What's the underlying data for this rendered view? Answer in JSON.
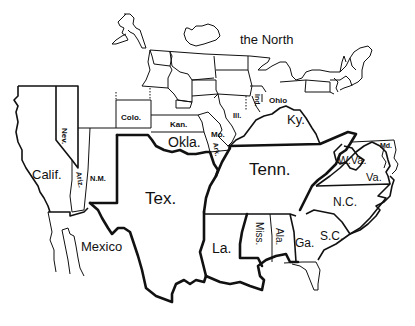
{
  "map": {
    "title_region": "the North",
    "colors": {
      "line": "#111111",
      "background": "#ffffff"
    },
    "labels": {
      "north": "the North",
      "nev": "Nev.",
      "calif": "Calif.",
      "ariz": "Ariz.",
      "nm": "N.M.",
      "colo": "Colo.",
      "kan": "Kan.",
      "okla": "Okla.",
      "mo": "Mo.",
      "ark": "Ark.",
      "ill": "Ill.",
      "ind": "Ind.",
      "ohio": "Ohio",
      "ky": "Ky.",
      "tenn": "Tenn.",
      "wva": "W.Va.",
      "md": "Md.",
      "va": "Va.",
      "nc": "N.C.",
      "sc": "S.C.",
      "ga": "Ga.",
      "ala": "Ala.",
      "miss": "Miss.",
      "la": "La.",
      "tex": "Tex.",
      "mexico": "Mexico"
    }
  }
}
